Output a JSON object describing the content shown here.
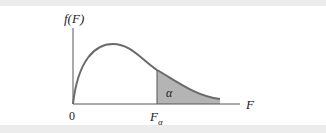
{
  "diagram": {
    "y_axis_label": "f(F)",
    "x_axis_label": "F",
    "origin_label": "0",
    "critical_value_label": "F",
    "critical_value_subscript": "α",
    "shaded_area_label": "α",
    "colors": {
      "curve": "#6a6a6a",
      "shade": "#b4b4b4",
      "axis": "#555555",
      "band": "#ececec"
    }
  }
}
